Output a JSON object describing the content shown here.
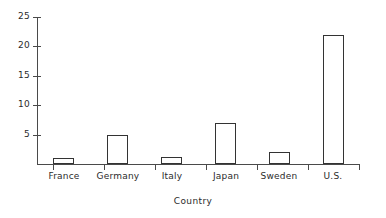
{
  "chart_data": {
    "type": "bar",
    "title": "",
    "xlabel": "Country",
    "ylabel": "",
    "categories": [
      "France",
      "Germany",
      "Italy",
      "Japan",
      "Sweden",
      "U.S."
    ],
    "values": [
      1,
      5,
      1.2,
      7,
      2,
      22
    ],
    "ylim": [
      0,
      25
    ],
    "yticks": [
      5,
      10,
      15,
      20,
      25
    ],
    "ytick_labels": [
      "5",
      "10",
      "15",
      "20",
      "25"
    ],
    "grid": false,
    "legend": false,
    "series": [
      {
        "name": "Country",
        "values": [
          1,
          5,
          1.2,
          7,
          2,
          22
        ]
      }
    ]
  },
  "style": {
    "bar_fill": "#ffffff",
    "bar_stroke": "#333333",
    "axis_color": "#4a4a4a",
    "text_color": "#2b2b2b",
    "background": "#ffffff"
  }
}
